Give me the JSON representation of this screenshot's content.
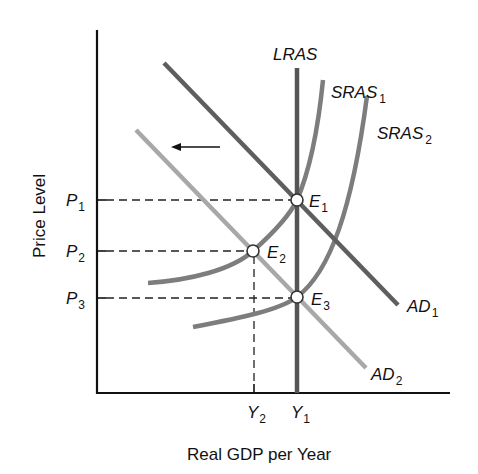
{
  "diagram": {
    "title": "",
    "x_axis_title": "Real GDP per Year",
    "y_axis_title": "Price Level",
    "y_ticks": [
      {
        "base": "P",
        "sub": "1"
      },
      {
        "base": "P",
        "sub": "2"
      },
      {
        "base": "P",
        "sub": "3"
      }
    ],
    "x_ticks": [
      {
        "base": "Y",
        "sub": "2"
      },
      {
        "base": "Y",
        "sub": "1"
      }
    ],
    "curves": {
      "lras": {
        "label": "LRAS"
      },
      "sras1": {
        "base": "SRAS",
        "sub": "1"
      },
      "sras2": {
        "base": "SRAS",
        "sub": "2"
      },
      "ad1": {
        "base": "AD",
        "sub": "1"
      },
      "ad2": {
        "base": "AD",
        "sub": "2"
      }
    },
    "points": [
      {
        "base": "E",
        "sub": "1"
      },
      {
        "base": "E",
        "sub": "2"
      },
      {
        "base": "E",
        "sub": "3"
      }
    ],
    "arrow": {
      "direction": "left",
      "meaning": "aggregate demand shift"
    },
    "colors": {
      "axis": "#111111",
      "lras": "#555555",
      "ad1": "#5e5e5e",
      "ad2": "#a8a8a8",
      "sras": "#7d7d7d",
      "dashed": "#222222"
    }
  }
}
